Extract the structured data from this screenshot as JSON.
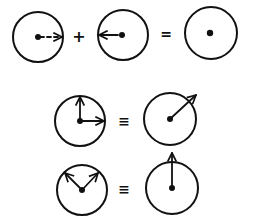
{
  "diagram": {
    "title": "",
    "background": "#ffffff",
    "ink_color": "#111111",
    "rows": [
      {
        "name": "cancellation",
        "operators": [
          "+",
          "="
        ],
        "items": [
          {
            "shape": "circle",
            "cx": 38,
            "cy": 37,
            "r": 25,
            "center_dot": true,
            "arrows": [
              {
                "to": [
                  63,
                  37
                ],
                "style": "dashed",
                "direction": "right"
              }
            ]
          },
          {
            "shape": "circle",
            "cx": 123,
            "cy": 35,
            "r": 25,
            "center_dot": true,
            "arrows": [
              {
                "to": [
                  98,
                  35
                ],
                "style": "solid",
                "direction": "left"
              }
            ]
          },
          {
            "shape": "circle",
            "cx": 211,
            "cy": 33,
            "r": 26,
            "center_dot": true,
            "arrows": []
          }
        ]
      },
      {
        "name": "perpendicular-sum",
        "operators": [
          "≡"
        ],
        "items": [
          {
            "shape": "circle",
            "cx": 80,
            "cy": 121,
            "r": 25,
            "center_dot": true,
            "arrows": [
              {
                "to": [
                  80,
                  96
                ],
                "style": "solid",
                "direction": "up"
              },
              {
                "to": [
                  105,
                  121
                ],
                "style": "solid",
                "direction": "right"
              }
            ]
          },
          {
            "shape": "circle",
            "cx": 170,
            "cy": 119,
            "r": 26,
            "center_dot": true,
            "arrows": [
              {
                "to": [
                  197,
                  94
                ],
                "style": "solid",
                "direction": "up-right"
              }
            ]
          }
        ]
      },
      {
        "name": "v-sum",
        "operators": [
          "≡"
        ],
        "items": [
          {
            "shape": "circle",
            "cx": 82,
            "cy": 190,
            "r": 25,
            "center_dot": true,
            "arrows": [
              {
                "to": [
                  64,
                  172
                ],
                "style": "solid",
                "direction": "up-left"
              },
              {
                "to": [
                  99,
                  172
                ],
                "style": "solid",
                "direction": "up-right"
              }
            ]
          },
          {
            "shape": "circle",
            "cx": 172,
            "cy": 188,
            "r": 26,
            "center_dot": true,
            "arrows": [
              {
                "to": [
                  172,
                  152
                ],
                "style": "solid",
                "direction": "up"
              }
            ]
          }
        ]
      }
    ],
    "symbols": {
      "plus": "+",
      "equals": "=",
      "equivalent": "≡"
    }
  }
}
